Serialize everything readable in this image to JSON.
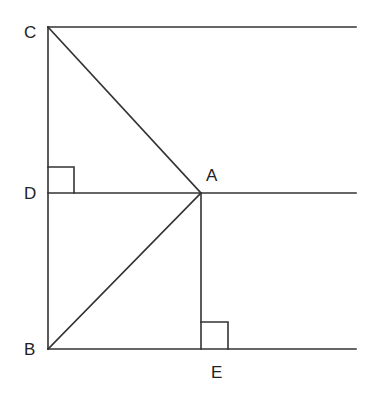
{
  "diagram": {
    "type": "geometry",
    "stroke_color": "#333333",
    "points": {
      "C": {
        "label": "C",
        "x": 48,
        "y": 27
      },
      "D": {
        "label": "D",
        "x": 48,
        "y": 193
      },
      "B": {
        "label": "B",
        "x": 48,
        "y": 349
      },
      "A": {
        "label": "A",
        "x": 201,
        "y": 193
      },
      "E": {
        "label": "E",
        "x": 201,
        "y": 349
      }
    },
    "segments": [
      {
        "name": "line-C-top",
        "from": [
          48,
          27
        ],
        "to": [
          356,
          27
        ]
      },
      {
        "name": "line-D-A-extended",
        "from": [
          48,
          193
        ],
        "to": [
          356,
          193
        ]
      },
      {
        "name": "line-B-E-extended",
        "from": [
          48,
          349
        ],
        "to": [
          356,
          349
        ]
      },
      {
        "name": "segment-C-B",
        "from": [
          48,
          27
        ],
        "to": [
          48,
          349
        ]
      },
      {
        "name": "segment-C-A",
        "from": [
          48,
          27
        ],
        "to": [
          201,
          193
        ]
      },
      {
        "name": "segment-B-A",
        "from": [
          48,
          349
        ],
        "to": [
          201,
          193
        ]
      },
      {
        "name": "segment-A-E",
        "from": [
          201,
          193
        ],
        "to": [
          201,
          349
        ]
      }
    ],
    "right_angles": [
      {
        "name": "right-angle-D",
        "at": "D"
      },
      {
        "name": "right-angle-E",
        "at": "E"
      }
    ],
    "labels": {
      "C": "C",
      "D": "D",
      "B": "B",
      "A": "A",
      "E": "E"
    }
  }
}
